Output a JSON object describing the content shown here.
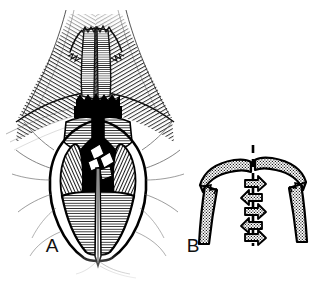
{
  "figure": {
    "type": "medical-line-illustration",
    "style": "pen-and-ink hatched engraving",
    "background_color": "#ffffff",
    "ink_color": "#000000",
    "width": 316,
    "height": 282,
    "panel_count": 2
  },
  "panels": [
    {
      "id": "A",
      "label": "A",
      "label_x": 52,
      "label_y": 252,
      "name": "surgical-exposure-view",
      "description": "Detailed anatomical surgical exposure rendered with dense line hatching, showing retracted soft tissue flaps, a dark midline cleft, paired cartilaginous structures and a vertical midline suture line.",
      "bounds": {
        "x": 8,
        "y": 2,
        "width": 172,
        "height": 272
      }
    },
    {
      "id": "B",
      "label": "B",
      "label_x": 193,
      "label_y": 252,
      "name": "schematic-closure-diagram",
      "description": "Schematic diagram of stippled arc-shaped flaps with interdigitating zigzag arrows advancing toward a dashed vertical midline.",
      "bounds": {
        "x": 186,
        "y": 140,
        "width": 124,
        "height": 120
      }
    }
  ],
  "panel_a_elements": {
    "upper_tissue_fold": "broad hatched tissue sheet sweeping outward left and right at top",
    "midline_column": "vertical paired columns with fine horizontal hatching",
    "dark_transverse_band": "solid black serrated transverse band at mid-height",
    "cartilage_plates": "paired hatched plates flanking the midline below the dark band",
    "deep_cavity": "solid black deep cavity at center",
    "lateral_lobes": "two elongate hatched lobes flanking the cavity",
    "lower_flap": "broad horizontally hatched lower flap",
    "midline_suture_line": "thin vertical midline running to the inferior apex",
    "outer_contour": "oval heavy outline enclosing the lower field"
  },
  "panel_b_elements": {
    "midline": {
      "name": "dashed-midline",
      "style": "dashed",
      "x": 253,
      "y_top": 145,
      "y_bottom": 245
    },
    "left_arc_flap": "stippled arc flap curving from lower-left up to the midline, notched tip",
    "right_arc_flap": "stippled arc flap curving from lower-right up to the midline, notched tip",
    "left_leg": "stippled vertical strut descending from left arc",
    "right_leg": "stippled vertical strut descending from right arc",
    "arrows": [
      {
        "index": 1,
        "direction": "right-down",
        "y": 186
      },
      {
        "index": 2,
        "direction": "left-down",
        "y": 200
      },
      {
        "index": 3,
        "direction": "right-down",
        "y": 213
      },
      {
        "index": 4,
        "direction": "left-down",
        "y": 226
      },
      {
        "index": 5,
        "direction": "right-down",
        "y": 236
      }
    ],
    "fill_pattern": "stipple-dot"
  },
  "colors": {
    "ink": "#000000",
    "paper": "#ffffff",
    "label_ink": "#111111",
    "stipple": "#000000"
  }
}
